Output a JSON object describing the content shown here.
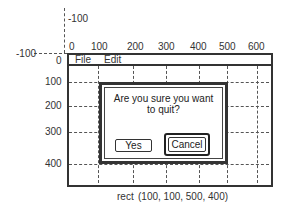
{
  "diagram": {
    "x_axis": {
      "origin_label": "0",
      "neg_label": "-100",
      "ticks": [
        "0",
        "100",
        "200",
        "300",
        "400",
        "500",
        "600"
      ]
    },
    "y_axis": {
      "origin_label": "0",
      "neg_label": "-100",
      "ticks": [
        "0",
        "100",
        "200",
        "300",
        "400"
      ]
    },
    "window": {
      "menu": [
        "File",
        "Edit"
      ]
    },
    "dialog": {
      "message_line1": "Are you sure you want",
      "message_line2": "to quit?",
      "yes_label": "Yes",
      "cancel_label": "Cancel"
    },
    "caption": {
      "keyword": "rect",
      "value": "(100, 100, 500, 400)"
    }
  }
}
